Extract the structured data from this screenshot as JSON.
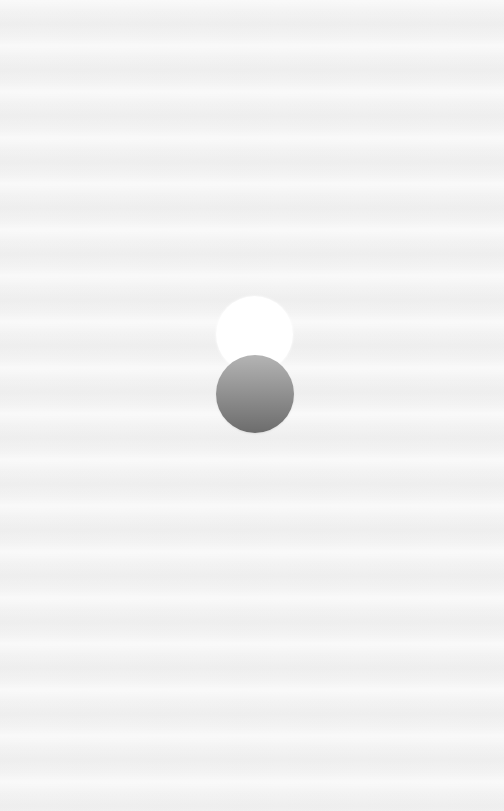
{
  "scene": {
    "background_color": "#f3f3f3",
    "shapes": [
      {
        "kind": "circle",
        "role": "light-orb",
        "color_top": "#ffffff",
        "color_bottom": "#f6f6f6"
      },
      {
        "kind": "circle",
        "role": "dark-orb",
        "color_top": "#b4b4b4",
        "color_bottom": "#6c6c6c"
      }
    ]
  }
}
